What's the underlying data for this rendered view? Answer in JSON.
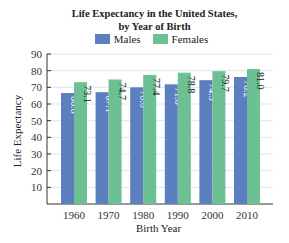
{
  "chart_data": {
    "type": "bar",
    "title_lines": [
      "Life Expectancy in the United States,",
      "by Year of Birth"
    ],
    "xlabel": "Birth Year",
    "ylabel": "Life Expectancy",
    "categories": [
      "1960",
      "1970",
      "1980",
      "1990",
      "2000",
      "2010"
    ],
    "series": [
      {
        "name": "Males",
        "color": "#5b7fbf",
        "values": [
          66.6,
          67.1,
          70.0,
          71.8,
          74.3,
          76.2
        ],
        "labels": [
          "66.6",
          "67.1",
          "70.0",
          "71.8",
          "74.3",
          "76.2"
        ]
      },
      {
        "name": "Females",
        "color": "#6dbf94",
        "values": [
          73.1,
          74.7,
          77.4,
          78.8,
          79.7,
          81.0
        ],
        "labels": [
          "73.1",
          "74.7",
          "77.4",
          "78.8",
          "79.7",
          "81.0"
        ]
      }
    ],
    "ylim": [
      0,
      90
    ],
    "yticks": [
      10,
      20,
      30,
      40,
      50,
      60,
      70,
      80,
      90
    ],
    "grid": true,
    "legend_position": "top"
  }
}
